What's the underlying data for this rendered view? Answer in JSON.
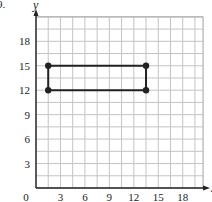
{
  "question_number": "9.",
  "chart_data": {
    "type": "scatter",
    "title": "",
    "xlabel": "x",
    "ylabel": "y",
    "xlim": [
      0,
      20.5
    ],
    "ylim": [
      0,
      21
    ],
    "grid": true,
    "grid_step": 1.5,
    "xticks": [
      0,
      3,
      6,
      9,
      12,
      15,
      18
    ],
    "yticks": [
      3,
      6,
      9,
      12,
      15,
      18
    ],
    "origin_label": "0",
    "series": [
      {
        "name": "rectangle",
        "closed": true,
        "points": [
          [
            1.5,
            15
          ],
          [
            13.5,
            15
          ],
          [
            13.5,
            12
          ],
          [
            1.5,
            12
          ]
        ]
      }
    ]
  }
}
